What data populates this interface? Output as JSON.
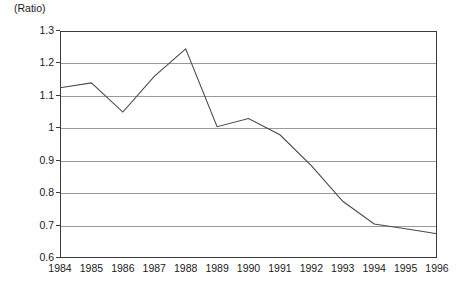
{
  "chart_data": {
    "type": "line",
    "title": "",
    "subtitle": "",
    "unit_label": "(Ratio)",
    "xlabel": "",
    "ylabel": "Ratio",
    "categories": [
      "1984",
      "1985",
      "1986",
      "1987",
      "1988",
      "1989",
      "1990",
      "1991",
      "1992",
      "1993",
      "1994",
      "1995",
      "1996"
    ],
    "values": [
      1.125,
      1.14,
      1.05,
      1.16,
      1.245,
      1.005,
      1.03,
      0.98,
      0.885,
      0.775,
      0.705,
      0.69,
      0.675
    ],
    "series": [
      {
        "name": "Ratio",
        "values": [
          1.125,
          1.14,
          1.05,
          1.16,
          1.245,
          1.005,
          1.03,
          0.98,
          0.885,
          0.775,
          0.705,
          0.69,
          0.675
        ]
      }
    ],
    "ylim": [
      0.6,
      1.3
    ],
    "ytick_labels": [
      "1.3",
      "1.2",
      "1.1",
      "1",
      "0.9",
      "0.8",
      "0.7",
      "0.6"
    ],
    "ytick_values": [
      1.3,
      1.2,
      1.1,
      1.0,
      0.9,
      0.8,
      0.7,
      0.6
    ],
    "xtick_labels": [
      "1984",
      "1985",
      "1986",
      "1987",
      "1988",
      "1989",
      "1990",
      "1991",
      "1992",
      "1993",
      "1994",
      "1995",
      "1996"
    ],
    "grid": true,
    "grid_axis": "y",
    "legend": false,
    "legend_position": "none",
    "line_color": "#4a4a4a",
    "grid_color": "#9a9a9a",
    "frame_color": "#3b3b3b",
    "background_color": "#ffffff",
    "annotations": []
  }
}
